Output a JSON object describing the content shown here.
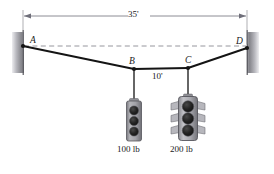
{
  "diagram": {
    "type": "statics-cable-free-body",
    "points": [
      {
        "id": "A",
        "label": "A",
        "x": 23,
        "y": 46,
        "kind": "support-pin-left-wall"
      },
      {
        "id": "B",
        "label": "B",
        "x": 134,
        "y": 69,
        "kind": "load-node"
      },
      {
        "id": "C",
        "label": "C",
        "x": 188,
        "y": 68,
        "kind": "load-node"
      },
      {
        "id": "D",
        "label": "D",
        "x": 247,
        "y": 48,
        "kind": "support-pin-right-wall"
      }
    ],
    "segments": [
      {
        "from": "A",
        "to": "B"
      },
      {
        "from": "B",
        "to": "C"
      },
      {
        "from": "C",
        "to": "D"
      }
    ],
    "reference_line": {
      "name": "horizontal-datum-from-A-to-D",
      "style": "dashed",
      "from": "A",
      "to": "D"
    },
    "dimensions": [
      {
        "id": "span-AD",
        "label": "35'",
        "value": 35,
        "unit": "ft",
        "orientation": "horizontal",
        "position": "top",
        "from_x": 23,
        "to_x": 247
      },
      {
        "id": "span-BC",
        "label": "10'",
        "value": 10,
        "unit": "ft",
        "orientation": "horizontal",
        "position": "below-segment-BC"
      }
    ],
    "loads": [
      {
        "id": "load-B",
        "label": "100 lb",
        "value": 100,
        "unit": "lb",
        "attached_to": "B",
        "fixture": "traffic-signal-small",
        "lamp_count": 3,
        "has_visors": false
      },
      {
        "id": "load-C",
        "label": "200 lb",
        "value": 200,
        "unit": "lb",
        "attached_to": "C",
        "fixture": "traffic-signal-large",
        "lamp_count": 3,
        "has_visors": true
      }
    ],
    "supports": [
      {
        "id": "wall-left",
        "name": "left-wall",
        "side": "left"
      },
      {
        "id": "wall-right",
        "name": "right-wall",
        "side": "right"
      }
    ],
    "colors": {
      "cable": "#141414",
      "dimension_line": "#6f6f7a",
      "dashed_reference": "#8a8a92",
      "wall_dark": "#7c7c82",
      "wall_light": "#e9e9ec",
      "signal_body": "#9a9a9e",
      "signal_body_dark": "#6e6e74",
      "lamp": "#1d1d1d",
      "text": "#1a1a1a",
      "background": "#ffffff"
    }
  }
}
